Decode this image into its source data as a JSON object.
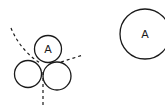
{
  "diagram": {
    "cluster": {
      "top_circle": {
        "label": "A",
        "cx": 48,
        "cy": 49,
        "r": 13.5
      },
      "bottom_left_circle": {
        "label": "",
        "cx": 28,
        "cy": 74,
        "r": 13.5
      },
      "bottom_right_circle": {
        "label": "",
        "cx": 57,
        "cy": 76,
        "r": 14
      }
    },
    "isolated_circle": {
      "label": "A",
      "cx": 145,
      "cy": 34,
      "r": 25
    },
    "dashed_lines": [
      {
        "name": "left-curve",
        "from": [
          11,
          28
        ],
        "to": [
          40,
          63
        ]
      },
      {
        "name": "right-line",
        "from": [
          60,
          62
        ],
        "to": [
          83,
          55
        ]
      },
      {
        "name": "vertical-line",
        "from": [
          43,
          72
        ],
        "to": [
          43,
          106
        ]
      }
    ],
    "colors": {
      "stroke": "#1a1a1a",
      "background": "#ffffff"
    }
  }
}
